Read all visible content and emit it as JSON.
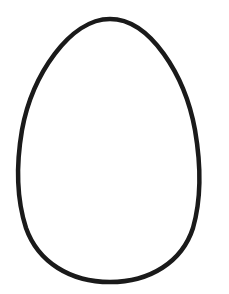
{
  "image": {
    "subject": "egg outline",
    "description": "Simple black outline of an egg shape on a white background",
    "background_color": "#ffffff",
    "stroke_color": "#1a1a1a",
    "stroke_width": 4
  }
}
